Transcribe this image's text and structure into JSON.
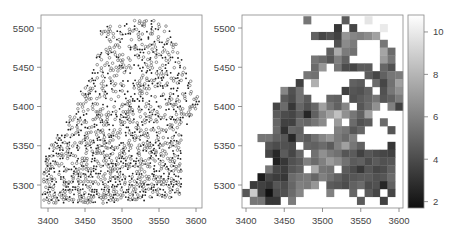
{
  "chart_data": [
    {
      "type": "scatter",
      "title": "",
      "xlabel": "",
      "ylabel": "",
      "xlim": [
        3392,
        3605
      ],
      "ylim": [
        5270,
        5515
      ],
      "x_ticks": [
        3400,
        3450,
        3500,
        3550,
        3600
      ],
      "y_ticks": [
        5300,
        5350,
        5400,
        5450,
        5500
      ],
      "grid": false,
      "legend": null,
      "marker_types": [
        "filled-dot",
        "open-circle"
      ],
      "description": "Spatial point locations; two symbol classes (small filled dots and open circles) forming a triangular cloud denser in the lower-left",
      "extent_rows": [
        {
          "y": 5510,
          "x_min": 3520,
          "x_max": 3540
        },
        {
          "y": 5500,
          "x_min": 3470,
          "x_max": 3565
        },
        {
          "y": 5480,
          "x_min": 3475,
          "x_max": 3575
        },
        {
          "y": 5460,
          "x_min": 3465,
          "x_max": 3580
        },
        {
          "y": 5440,
          "x_min": 3460,
          "x_max": 3590
        },
        {
          "y": 5420,
          "x_min": 3445,
          "x_max": 3600
        },
        {
          "y": 5400,
          "x_min": 3440,
          "x_max": 3605
        },
        {
          "y": 5380,
          "x_min": 3425,
          "x_max": 3590
        },
        {
          "y": 5360,
          "x_min": 3410,
          "x_max": 3580
        },
        {
          "y": 5340,
          "x_min": 3398,
          "x_max": 3580
        },
        {
          "y": 5320,
          "x_min": 3395,
          "x_max": 3582
        },
        {
          "y": 5300,
          "x_min": 3395,
          "x_max": 3582
        },
        {
          "y": 5285,
          "x_min": 3392,
          "x_max": 3580
        },
        {
          "y": 5275,
          "x_min": 3400,
          "x_max": 3460
        }
      ]
    },
    {
      "type": "heatmap",
      "title": "",
      "xlabel": "",
      "ylabel": "",
      "xlim": [
        3395,
        3605
      ],
      "ylim": [
        5270,
        5515
      ],
      "x_ticks": [
        3400,
        3450,
        3500,
        3550,
        3600
      ],
      "y_ticks": [
        5300,
        5350,
        5400,
        5450,
        5500
      ],
      "colorbar": {
        "ticks": [
          2,
          4,
          6,
          8,
          10
        ],
        "range": [
          1.7,
          10.8
        ],
        "colormap": "grayscale black-to-white"
      },
      "cell_size": 10,
      "x_start": 3395,
      "y_top": 5515,
      "rows": [
        [
          null,
          null,
          null,
          null,
          null,
          null,
          null,
          null,
          5.6,
          null,
          null,
          null,
          null,
          4.6,
          null,
          null,
          9.8,
          null,
          null,
          null,
          null
        ],
        [
          null,
          null,
          null,
          null,
          null,
          null,
          null,
          null,
          null,
          null,
          null,
          null,
          3.2,
          null,
          3.8,
          null,
          null,
          null,
          10,
          null,
          null
        ],
        [
          null,
          null,
          null,
          null,
          null,
          null,
          null,
          null,
          null,
          4.8,
          3.8,
          4.2,
          3.6,
          6.8,
          6.2,
          6.0,
          6.4,
          7.2,
          null,
          null,
          null
        ],
        [
          null,
          null,
          null,
          null,
          null,
          null,
          null,
          null,
          null,
          null,
          null,
          null,
          4.2,
          6.4,
          5.8,
          null,
          null,
          null,
          5.6,
          null,
          null
        ],
        [
          null,
          null,
          null,
          null,
          null,
          null,
          null,
          null,
          null,
          null,
          null,
          4.8,
          7.6,
          5.8,
          5.4,
          null,
          null,
          null,
          7.4,
          5.2,
          null
        ],
        [
          null,
          null,
          null,
          null,
          null,
          null,
          null,
          null,
          null,
          5.6,
          5.2,
          4.4,
          6.0,
          4.8,
          null,
          null,
          null,
          null,
          7.0,
          5.6,
          null
        ],
        [
          null,
          null,
          null,
          null,
          null,
          null,
          null,
          null,
          null,
          5.2,
          6.8,
          null,
          5.6,
          4.0,
          3.8,
          4.6,
          4.6,
          null,
          5.0,
          4.2,
          null
        ],
        [
          null,
          null,
          null,
          null,
          null,
          null,
          null,
          null,
          5.6,
          5.4,
          null,
          null,
          null,
          null,
          null,
          null,
          4.6,
          3.8,
          4.8,
          5.6,
          5.8
        ],
        [
          null,
          null,
          null,
          null,
          null,
          null,
          null,
          3.6,
          null,
          7.8,
          null,
          null,
          null,
          null,
          4.8,
          4.6,
          null,
          5.2,
          3.8,
          5.4,
          7.2
        ],
        [
          null,
          null,
          null,
          null,
          null,
          6.2,
          4.2,
          5.4,
          null,
          null,
          null,
          null,
          null,
          3.6,
          4.4,
          4.2,
          4.8,
          null,
          4.2,
          5.6,
          6.6
        ],
        [
          null,
          null,
          null,
          null,
          null,
          4.6,
          4.0,
          5.4,
          4.6,
          null,
          null,
          5.0,
          4.8,
          null,
          4.2,
          4.6,
          5.0,
          5.6,
          4.4,
          4.8,
          5.8
        ],
        [
          null,
          null,
          null,
          null,
          3.8,
          5.2,
          3.2,
          5.0,
          4.2,
          5.0,
          7.2,
          5.6,
          4.8,
          6.2,
          null,
          4.4,
          5.2,
          6.6,
          null,
          6.0,
          3.6
        ],
        [
          null,
          null,
          null,
          null,
          4.6,
          4.0,
          3.8,
          4.6,
          2.6,
          4.8,
          6.2,
          7.2,
          8.4,
          6.6,
          5.6,
          4.8,
          7.2,
          null,
          null,
          null,
          null
        ],
        [
          null,
          null,
          null,
          null,
          5.0,
          3.6,
          3.6,
          5.2,
          5.0,
          5.6,
          6.4,
          null,
          7.0,
          null,
          5.2,
          4.2,
          4.6,
          null,
          5.2,
          null,
          null
        ],
        [
          null,
          null,
          null,
          null,
          5.2,
          3.0,
          5.0,
          4.8,
          null,
          null,
          null,
          null,
          6.0,
          5.6,
          4.4,
          5.0,
          null,
          null,
          null,
          4.4,
          null
        ],
        [
          null,
          null,
          5.6,
          5.6,
          4.8,
          4.4,
          2.6,
          5.0,
          4.6,
          5.4,
          6.2,
          6.8,
          5.8,
          5.2,
          6.0,
          null,
          null,
          null,
          null,
          null,
          null
        ],
        [
          null,
          null,
          null,
          4.4,
          4.0,
          4.2,
          4.0,
          null,
          5.0,
          4.8,
          5.2,
          4.6,
          6.0,
          7.2,
          5.6,
          4.8,
          null,
          null,
          null,
          3.2,
          null
        ],
        [
          null,
          null,
          null,
          3.8,
          2.6,
          4.6,
          3.8,
          5.0,
          null,
          5.4,
          6.6,
          5.8,
          5.4,
          4.4,
          4.6,
          3.6,
          4.4,
          4.0,
          3.8,
          3.6,
          null
        ],
        [
          null,
          null,
          null,
          null,
          2.4,
          3.2,
          4.2,
          4.6,
          6.0,
          5.2,
          6.0,
          7.0,
          6.4,
          5.4,
          4.6,
          4.8,
          4.0,
          4.6,
          4.2,
          4.4,
          null
        ],
        [
          null,
          null,
          null,
          5.6,
          3.8,
          3.4,
          4.4,
          4.8,
          null,
          7.6,
          5.6,
          5.4,
          null,
          4.6,
          4.0,
          3.2,
          4.4,
          3.8,
          4.0,
          4.8,
          null
        ],
        [
          null,
          null,
          2.2,
          3.8,
          3.4,
          3.2,
          5.2,
          5.6,
          5.8,
          5.0,
          6.0,
          5.4,
          4.8,
          4.2,
          4.4,
          4.6,
          4.6,
          4.2,
          4.4,
          5.2,
          null
        ],
        [
          null,
          3.4,
          3.6,
          3.2,
          4.4,
          4.0,
          5.0,
          6.0,
          5.8,
          6.8,
          null,
          4.6,
          4.4,
          4.0,
          4.8,
          5.2,
          4.0,
          4.2,
          2.6,
          4.8,
          null
        ],
        [
          4.4,
          8.8,
          3.6,
          1.8,
          4.0,
          4.2,
          5.2,
          6.2,
          null,
          null,
          null,
          6.0,
          null,
          null,
          5.0,
          null,
          4.6,
          3.8,
          null,
          3.8,
          null
        ],
        [
          null,
          5.6,
          5.6,
          3.2,
          3.2,
          null,
          5.8,
          null,
          null,
          null,
          null,
          null,
          null,
          null,
          null,
          4.6,
          null,
          null,
          3.6,
          null,
          null
        ]
      ]
    }
  ]
}
